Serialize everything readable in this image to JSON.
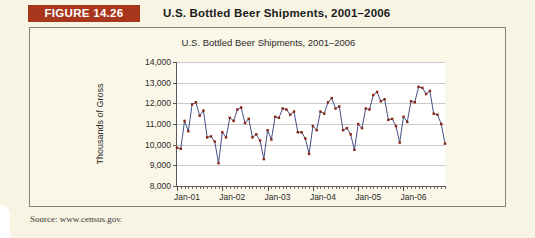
{
  "figure": {
    "badge_label": "FIGURE 14.26",
    "caption": "U.S. Bottled Beer Shipments, 2001–2006",
    "source_note": "Source: www.census.gov.",
    "badge_color": "#a8361c",
    "panel_background": "#faf7e8",
    "page_background": "#f7f4e4"
  },
  "chart_data": {
    "type": "line",
    "title": "U.S. Bottled Beer Shipments, 2001–2006",
    "xlabel": "",
    "ylabel": "Thousands of Gross",
    "ylim": [
      8000,
      14000
    ],
    "yticks": [
      8000,
      9000,
      10000,
      11000,
      12000,
      13000,
      14000
    ],
    "ytick_labels": [
      "8,000",
      "9,000",
      "10,000",
      "11,000",
      "12,000",
      "13,000",
      "14,000"
    ],
    "grid": true,
    "legend": false,
    "line_color": "#2f3b77",
    "marker_color": "#8c2310",
    "marker_shape": "square",
    "x_tick_labels": [
      "Jan-01",
      "Jan-02",
      "Jan-03",
      "Jan-04",
      "Jan-05",
      "Jan-06"
    ],
    "x_tick_label_positions": [
      0,
      12,
      24,
      36,
      48,
      60
    ],
    "x_minor_tick_count": 72,
    "x": [
      "Jan-01",
      "Feb-01",
      "Mar-01",
      "Apr-01",
      "May-01",
      "Jun-01",
      "Jul-01",
      "Aug-01",
      "Sep-01",
      "Oct-01",
      "Nov-01",
      "Dec-01",
      "Jan-02",
      "Feb-02",
      "Mar-02",
      "Apr-02",
      "May-02",
      "Jun-02",
      "Jul-02",
      "Aug-02",
      "Sep-02",
      "Oct-02",
      "Nov-02",
      "Dec-02",
      "Jan-03",
      "Feb-03",
      "Mar-03",
      "Apr-03",
      "May-03",
      "Jun-03",
      "Jul-03",
      "Aug-03",
      "Sep-03",
      "Oct-03",
      "Nov-03",
      "Dec-03",
      "Jan-04",
      "Feb-04",
      "Mar-04",
      "Apr-04",
      "May-04",
      "Jun-04",
      "Jul-04",
      "Aug-04",
      "Sep-04",
      "Oct-04",
      "Nov-04",
      "Dec-04",
      "Jan-05",
      "Feb-05",
      "Mar-05",
      "Apr-05",
      "May-05",
      "Jun-05",
      "Jul-05",
      "Aug-05",
      "Sep-05",
      "Oct-05",
      "Nov-05",
      "Dec-05",
      "Jan-06",
      "Feb-06",
      "Mar-06",
      "Apr-06",
      "May-06",
      "Jun-06",
      "Jul-06",
      "Aug-06",
      "Sep-06",
      "Oct-06",
      "Nov-06",
      "Dec-06"
    ],
    "values": [
      9850,
      9800,
      11150,
      10650,
      11950,
      12050,
      11400,
      11650,
      10350,
      10400,
      10150,
      9100,
      10600,
      10350,
      11300,
      11150,
      11700,
      11800,
      11050,
      11250,
      10350,
      10500,
      10200,
      9300,
      10700,
      10250,
      11350,
      11300,
      11750,
      11700,
      11450,
      11600,
      10600,
      10600,
      10300,
      9550,
      10900,
      10700,
      11600,
      11500,
      12050,
      12250,
      11750,
      11850,
      10700,
      10800,
      10500,
      9750,
      11000,
      10800,
      11750,
      11700,
      12400,
      12550,
      12100,
      12200,
      11200,
      11250,
      10900,
      10100,
      11350,
      11100,
      12100,
      12050,
      12800,
      12750,
      12450,
      12600,
      11500,
      11450,
      11000,
      10050
    ],
    "series_name": "U.S. Bottled Beer Shipments"
  }
}
